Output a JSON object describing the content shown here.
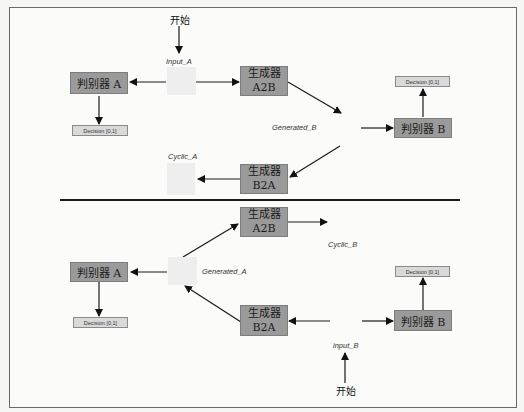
{
  "diagram": {
    "top": {
      "start_label": "开始",
      "input_label": "Input_A",
      "discriminator_a": "判别器 A",
      "decision_a": "Decision [0,1]",
      "generator_a2b": {
        "line1": "生成器",
        "line2": "A2B"
      },
      "generated_label": "Generated_B",
      "discriminator_b": "判别器 B",
      "decision_b": "Decision [0,1]",
      "generator_b2a": {
        "line1": "生成器",
        "line2": "B2A"
      },
      "cyclic_label": "Cyclic_A"
    },
    "bottom": {
      "generator_a2b": {
        "line1": "生成器",
        "line2": "A2B"
      },
      "cyclic_label": "Cyclic_B",
      "generated_label": "Generated_A",
      "discriminator_a": "判别器 A",
      "decision_a": "Decision [0,1]",
      "generator_b2a": {
        "line1": "生成器",
        "line2": "B2A"
      },
      "discriminator_b": "判别器 B",
      "decision_b": "Decision [0,1]",
      "input_label": "input_B",
      "start_label": "开始"
    },
    "colors": {
      "node_fill": "#9a9a9a",
      "decision_fill": "#d9d9d9",
      "placeholder_fill": "#eeeeee",
      "line": "#1a1a1a"
    }
  }
}
